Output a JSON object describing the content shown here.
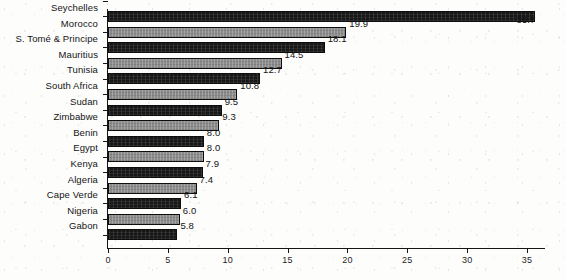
{
  "chart_data": {
    "type": "bar",
    "orientation": "horizontal",
    "title": "",
    "subtitle": "",
    "xlabel": "",
    "ylabel": "",
    "xlim": [
      0,
      36.5
    ],
    "xticks": [
      0,
      5,
      10,
      15,
      20,
      25,
      30,
      35
    ],
    "xtick_labels": [
      "0",
      "5",
      "10",
      "15",
      "20",
      "25",
      "30",
      "35"
    ],
    "grid": false,
    "legend": false,
    "categories": [
      "Seychelles",
      "Morocco",
      "S. Tomé & Principe",
      "Mauritius",
      "Tunisia",
      "South Africa",
      "Sudan",
      "Zimbabwe",
      "Benin",
      "Egypt",
      "Kenya",
      "Algeria",
      "Cape Verde",
      "Nigeria",
      "Gabon"
    ],
    "values": [
      35.7,
      19.9,
      18.1,
      14.5,
      12.7,
      10.8,
      9.5,
      9.3,
      8.0,
      8.0,
      7.9,
      7.4,
      6.1,
      6.0,
      5.8
    ],
    "value_labels": [
      "35.7",
      "19.9",
      "18.1",
      "14.5",
      "12.7",
      "10.8",
      "9.5",
      "9.3",
      "8.0",
      "8.0",
      "7.9",
      "7.4",
      "6.1",
      "6.0",
      "5.8"
    ],
    "bar_shades": [
      "dark",
      "light",
      "dark",
      "light",
      "dark",
      "light",
      "dark",
      "light",
      "dark",
      "light",
      "dark",
      "light",
      "dark",
      "light",
      "dark"
    ],
    "label_placement": [
      "below",
      "right",
      "right",
      "right",
      "right",
      "right",
      "right",
      "right",
      "right",
      "right",
      "right",
      "right",
      "right",
      "right",
      "right"
    ],
    "colors": {
      "bar_dark": "#171717",
      "bar_light": "#8c8c8c",
      "bar_outline": "#0d0d0d",
      "axis": "#151515",
      "text": "#141414",
      "background": "#fdfdfc"
    }
  }
}
